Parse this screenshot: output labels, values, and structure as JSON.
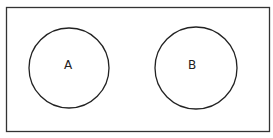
{
  "diagram": {
    "type": "venn",
    "universe": {
      "x": 6,
      "y": 7,
      "width": 263,
      "height": 125,
      "stroke": "#333333"
    },
    "sets": [
      {
        "label": "A",
        "cx": 69,
        "cy": 68,
        "r": 40
      },
      {
        "label": "B",
        "cx": 196,
        "cy": 68,
        "r": 41
      }
    ],
    "overlap": false
  }
}
